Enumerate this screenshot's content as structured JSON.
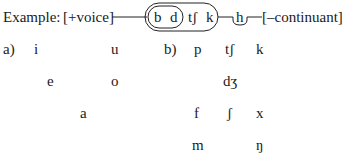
{
  "example": {
    "label": "Example:",
    "feature_left": "[+voice]",
    "inner_group": [
      "b",
      "d"
    ],
    "outer_extra": [
      "tʃ",
      "k"
    ],
    "separate": "h",
    "feature_right": "[–continuant]"
  },
  "part_a": {
    "label": "a)",
    "vowels": {
      "high_front": "i",
      "high_back": "u",
      "mid_front": "e",
      "mid_back": "o",
      "low_central": "a"
    }
  },
  "part_b": {
    "label": "b)",
    "row1": [
      "p",
      "tʃ",
      "k"
    ],
    "row2": [
      "dʒ"
    ],
    "row3": [
      "f",
      "ʃ",
      "x"
    ],
    "row4": [
      "m",
      "ŋ"
    ]
  }
}
